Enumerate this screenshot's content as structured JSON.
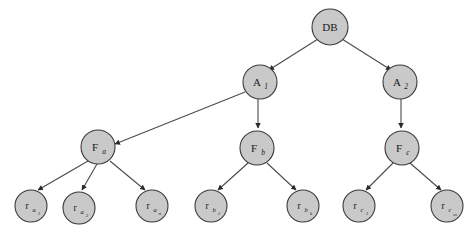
{
  "figure": {
    "kind": "tree-diagram",
    "background_color": "#ffffff",
    "node_fill": "#c9c9c9",
    "node_stroke": "#3a3a3a",
    "edge_color": "#4a4a4a",
    "label_color": "#1a1a1a"
  },
  "nodes": {
    "db": {
      "label": "DB",
      "sub": "",
      "sub2": ""
    },
    "a1": {
      "label": "A",
      "sub": "1",
      "sub2": ""
    },
    "a2": {
      "label": "A",
      "sub": "2",
      "sub2": ""
    },
    "fa": {
      "label": "F",
      "sub": "a",
      "sub2": ""
    },
    "fb": {
      "label": "F",
      "sub": "b",
      "sub2": ""
    },
    "fc": {
      "label": "F",
      "sub": "c",
      "sub2": ""
    },
    "ra1": {
      "label": "r",
      "sub": "a",
      "sub2": "1"
    },
    "ra2": {
      "label": "r",
      "sub": "a",
      "sub2": "2"
    },
    "ran": {
      "label": "r",
      "sub": "a",
      "sub2": "n"
    },
    "rb1": {
      "label": "r",
      "sub": "b",
      "sub2": "1"
    },
    "rbk": {
      "label": "r",
      "sub": "b",
      "sub2": "k"
    },
    "rc1": {
      "label": "r",
      "sub": "c",
      "sub2": "1"
    },
    "rcm": {
      "label": "r",
      "sub": "c",
      "sub2": "m"
    }
  },
  "edges": [
    {
      "from": "db",
      "to": "a1"
    },
    {
      "from": "db",
      "to": "a2"
    },
    {
      "from": "a1",
      "to": "fa"
    },
    {
      "from": "a1",
      "to": "fb"
    },
    {
      "from": "a2",
      "to": "fc"
    },
    {
      "from": "fa",
      "to": "ra1"
    },
    {
      "from": "fa",
      "to": "ra2"
    },
    {
      "from": "fa",
      "to": "ran"
    },
    {
      "from": "fb",
      "to": "rb1"
    },
    {
      "from": "fb",
      "to": "rbk"
    },
    {
      "from": "fc",
      "to": "rc1"
    },
    {
      "from": "fc",
      "to": "rcm"
    }
  ],
  "background_text": {
    "lines": [
      "",
      "",
      "",
      ""
    ]
  }
}
